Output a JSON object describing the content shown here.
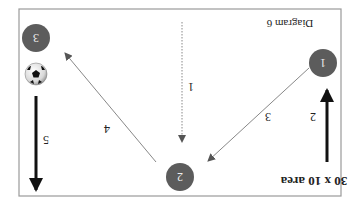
{
  "diagram": {
    "title": "30 x 10 area",
    "caption": "Diagram 6",
    "orientation": "rotated 180 degrees",
    "colors": {
      "frame": "#9a9a9a",
      "node_fill": "#5c5c5c",
      "node_text": "#eeeeee",
      "thin_arrow": "#8a8a8a",
      "thick_arrow": "#111111"
    },
    "nodes": [
      {
        "id": "1",
        "label": "1"
      },
      {
        "id": "2",
        "label": "2"
      },
      {
        "id": "3",
        "label": "3"
      }
    ],
    "arrows": [
      {
        "label": "1",
        "style": "dotted",
        "description": "vertical dotted arrow toward player 2"
      },
      {
        "label": "2",
        "style": "thick",
        "description": "player 1 run"
      },
      {
        "label": "3",
        "style": "thin",
        "description": "pass from player 1 to player 2"
      },
      {
        "label": "4",
        "style": "thin",
        "description": "pass from player 2 to player 3"
      },
      {
        "label": "5",
        "style": "thick",
        "description": "player 3 dribble"
      }
    ],
    "ball": {
      "icon": "soccer-ball-icon"
    }
  }
}
